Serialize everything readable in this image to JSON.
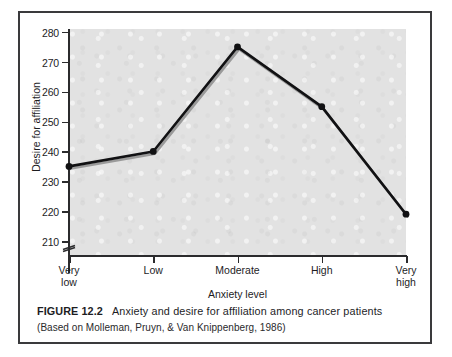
{
  "figure": {
    "caption_label": "FIGURE 12.2",
    "caption_text": "Anxiety and desire for affiliation among cancer patients",
    "caption_source": "(Based on Molleman, Pruyn, & Van Knippenberg, 1986)"
  },
  "colors": {
    "frame_border": "#3a3a3c",
    "plot_background": "#e2e2e2",
    "axis": "#2b2b2d",
    "line": "#111113",
    "line_shadow": "#9a9a9a",
    "marker": "#111113",
    "text": "#1d1d1f",
    "page_background": "#ffffff"
  },
  "chart_data": {
    "type": "line",
    "title": "",
    "xlabel": "Anxiety level",
    "ylabel": "Desire for affiliation",
    "categories": [
      "Very low",
      "Low",
      "Moderate",
      "High",
      "Very high"
    ],
    "category_lines": [
      [
        "Very",
        "low"
      ],
      [
        "Low",
        ""
      ],
      [
        "Moderate",
        ""
      ],
      [
        "High",
        ""
      ],
      [
        "Very",
        "high"
      ]
    ],
    "values": [
      235,
      240,
      275,
      255,
      219
    ],
    "ylim": [
      205,
      281
    ],
    "yticks": [
      210,
      220,
      230,
      240,
      250,
      260,
      270,
      280
    ],
    "ytick_labels": [
      "210",
      "220",
      "230",
      "240",
      "250",
      "260",
      "270",
      "280"
    ],
    "grid": false,
    "legend": false,
    "axis_break": true,
    "markers": "circle",
    "series": [
      {
        "name": "Desire for affiliation",
        "values": [
          235,
          240,
          275,
          255,
          219
        ]
      }
    ]
  }
}
